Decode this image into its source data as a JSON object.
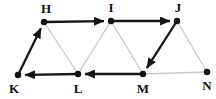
{
  "diagram": {
    "type": "directed-graph",
    "background": "#ffffff",
    "colors": {
      "solid_edge": "#161616",
      "light_edge": "#c9c9c9",
      "node_dot": "#111111",
      "label": "#111111"
    },
    "geometry": {
      "width": 216,
      "height": 99,
      "node_radius": 3.2,
      "solid_stroke_width": 2.3,
      "light_stroke_width": 1.3,
      "arrow_tip_gap": 7
    },
    "nodes": [
      {
        "id": "H",
        "label": "H",
        "x": 44,
        "y": 22,
        "label_dx": 2,
        "label_dy": -9
      },
      {
        "id": "I",
        "label": "I",
        "x": 111,
        "y": 21,
        "label_dx": 0,
        "label_dy": -9
      },
      {
        "id": "J",
        "label": "J",
        "x": 177,
        "y": 21,
        "label_dx": 1,
        "label_dy": -9
      },
      {
        "id": "K",
        "label": "K",
        "x": 18,
        "y": 75,
        "label_dx": -4,
        "label_dy": 18
      },
      {
        "id": "L",
        "label": "L",
        "x": 78,
        "y": 74,
        "label_dx": 0,
        "label_dy": 19
      },
      {
        "id": "M",
        "label": "M",
        "x": 143,
        "y": 74,
        "label_dx": 0,
        "label_dy": 19
      },
      {
        "id": "N",
        "label": "N",
        "x": 207,
        "y": 72,
        "label_dx": 0,
        "label_dy": 18
      }
    ],
    "edges": [
      {
        "from": "H",
        "to": "L",
        "style": "light",
        "directed": false
      },
      {
        "from": "I",
        "to": "L",
        "style": "light",
        "directed": false
      },
      {
        "from": "I",
        "to": "M",
        "style": "light",
        "directed": false
      },
      {
        "from": "J",
        "to": "N",
        "style": "light",
        "directed": false
      },
      {
        "from": "M",
        "to": "N",
        "style": "light",
        "directed": false
      },
      {
        "from": "K",
        "to": "H",
        "style": "solid",
        "directed": true
      },
      {
        "from": "H",
        "to": "I",
        "style": "solid",
        "directed": true
      },
      {
        "from": "I",
        "to": "J",
        "style": "solid",
        "directed": true
      },
      {
        "from": "J",
        "to": "M",
        "style": "solid",
        "directed": true
      },
      {
        "from": "M",
        "to": "L",
        "style": "solid",
        "directed": true
      },
      {
        "from": "L",
        "to": "K",
        "style": "solid",
        "directed": true
      }
    ]
  }
}
